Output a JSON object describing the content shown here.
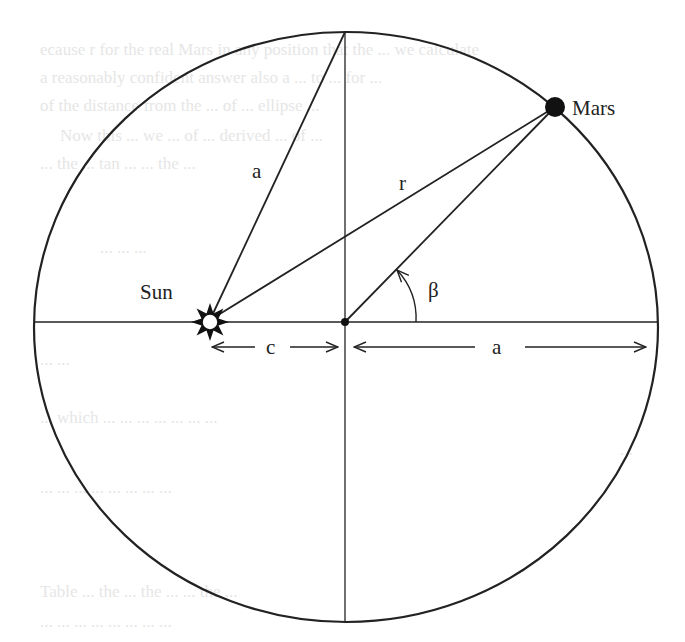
{
  "diagram": {
    "colors": {
      "stroke": "#222222",
      "background": "#ffffff",
      "ghost_text": "#e6e6e6"
    },
    "ellipse": {
      "cx": 345,
      "cy": 327,
      "rx": 311,
      "ry": 295
    },
    "labels": {
      "sun": "Sun",
      "mars": "Mars",
      "a_slant": "a",
      "r": "r",
      "beta": "β",
      "c": "c",
      "a_bottom": "a"
    },
    "points": {
      "sun": {
        "x": 210,
        "y": 322
      },
      "center": {
        "x": 345,
        "y": 322
      },
      "mars": {
        "x": 555,
        "y": 107
      },
      "top": {
        "x": 345,
        "y": 32
      }
    }
  },
  "background_text": {
    "lines": [
      "ecause r for the real Mars in any position that the ... we calculate",
      "a reasonably confident answer also a ... to ... for ...",
      "of the distance from the ... of ... ellipse ...",
      "Now this ... we ... of ... derived ... of ...",
      "... the ... tan ... ... the ...",
      "... ... ...",
      "... ...",
      "... which ... ... ... ... ... ... ...",
      "...",
      "... ... ... ... ... ... ... ...",
      "Table ... the ... the ... ... the ...",
      "... ... ... ... ... ... ... ..."
    ]
  }
}
